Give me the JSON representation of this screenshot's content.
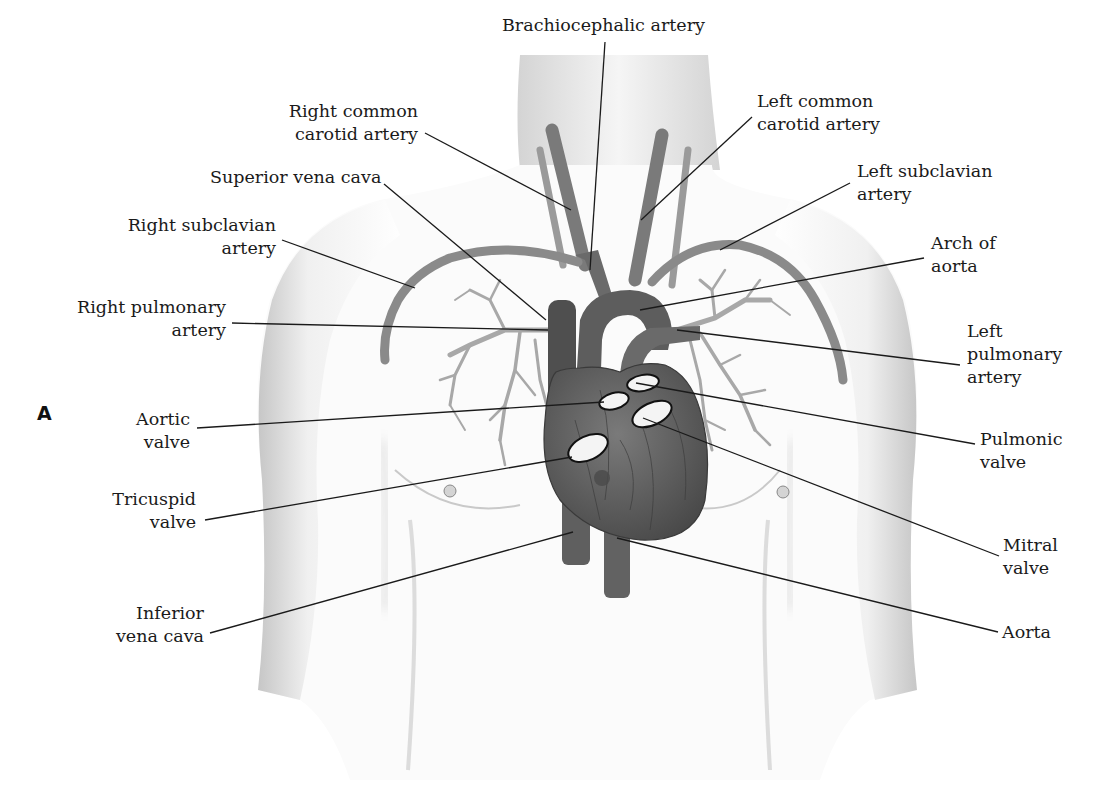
{
  "figure": {
    "panel_letter": "A",
    "type": "anatomical-diagram",
    "colors": {
      "background": "#ffffff",
      "skin_shade": "#c8c8c8",
      "vessel": "#6e6e6e",
      "heart": "#5a5a5a",
      "valve_fill": "#f4f4f4",
      "leader_line": "#1a1a1a",
      "text": "#1a1a1a"
    }
  },
  "labels": [
    {
      "id": "brachiocephalic-artery",
      "lines": [
        "Brachiocephalic artery"
      ],
      "align": "center",
      "x": 502,
      "y": 14,
      "w": 200,
      "anchor": [
        605,
        42
      ],
      "target": [
        590,
        270
      ]
    },
    {
      "id": "right-common-carotid-artery",
      "lines": [
        "Right common",
        "carotid artery"
      ],
      "align": "right",
      "x": 260,
      "y": 100,
      "w": 158,
      "anchor": [
        425,
        133
      ],
      "target": [
        571,
        210
      ]
    },
    {
      "id": "superior-vena-cava",
      "lines": [
        "Superior vena cava"
      ],
      "align": "right",
      "x": 210,
      "y": 166,
      "w": 166,
      "anchor": [
        384,
        184
      ],
      "target": [
        546,
        320
      ]
    },
    {
      "id": "right-subclavian-artery",
      "lines": [
        "Right subclavian",
        "artery"
      ],
      "align": "right",
      "x": 118,
      "y": 214,
      "w": 158,
      "anchor": [
        282,
        240
      ],
      "target": [
        415,
        288
      ]
    },
    {
      "id": "right-pulmonary-artery",
      "lines": [
        "Right pulmonary",
        "artery"
      ],
      "align": "right",
      "x": 60,
      "y": 296,
      "w": 166,
      "anchor": [
        232,
        323
      ],
      "target": [
        548,
        330
      ]
    },
    {
      "id": "left-common-carotid-artery",
      "lines": [
        "Left common",
        "carotid artery"
      ],
      "align": "left",
      "x": 757,
      "y": 90,
      "w": 160,
      "anchor": [
        752,
        117
      ],
      "target": [
        641,
        220
      ]
    },
    {
      "id": "left-subclavian-artery",
      "lines": [
        "Left subclavian",
        "artery"
      ],
      "align": "left",
      "x": 857,
      "y": 160,
      "w": 170,
      "anchor": [
        850,
        183
      ],
      "target": [
        720,
        250
      ]
    },
    {
      "id": "arch-of-aorta",
      "lines": [
        "Arch of",
        "aorta"
      ],
      "align": "left",
      "x": 931,
      "y": 232,
      "w": 100,
      "anchor": [
        924,
        258
      ],
      "target": [
        640,
        310
      ]
    },
    {
      "id": "left-pulmonary-artery",
      "lines": [
        "Left",
        "pulmonary",
        "artery"
      ],
      "align": "left",
      "x": 967,
      "y": 320,
      "w": 130,
      "anchor": [
        960,
        365
      ],
      "target": [
        677,
        330
      ]
    },
    {
      "id": "aortic-valve",
      "lines": [
        "Aortic",
        "valve"
      ],
      "align": "right",
      "x": 110,
      "y": 408,
      "w": 80,
      "anchor": [
        197,
        428
      ],
      "target": [
        604,
        402
      ]
    },
    {
      "id": "pulmonic-valve",
      "lines": [
        "Pulmonic",
        "valve"
      ],
      "align": "left",
      "x": 980,
      "y": 428,
      "w": 100,
      "anchor": [
        975,
        444
      ],
      "target": [
        636,
        383
      ]
    },
    {
      "id": "tricuspid-valve",
      "lines": [
        "Tricuspid",
        "valve"
      ],
      "align": "right",
      "x": 100,
      "y": 488,
      "w": 96,
      "anchor": [
        205,
        520
      ],
      "target": [
        572,
        457
      ]
    },
    {
      "id": "mitral-valve",
      "lines": [
        "Mitral",
        "valve"
      ],
      "align": "left",
      "x": 1003,
      "y": 534,
      "w": 80,
      "anchor": [
        999,
        556
      ],
      "target": [
        643,
        418
      ]
    },
    {
      "id": "inferior-vena-cava",
      "lines": [
        "Inferior",
        "vena cava"
      ],
      "align": "right",
      "x": 100,
      "y": 602,
      "w": 104,
      "anchor": [
        210,
        633
      ],
      "target": [
        573,
        532
      ]
    },
    {
      "id": "aorta",
      "lines": [
        "Aorta"
      ],
      "align": "left",
      "x": 1002,
      "y": 621,
      "w": 80,
      "anchor": [
        998,
        632
      ],
      "target": [
        617,
        538
      ]
    }
  ],
  "valves": [
    {
      "id": "pulmonic-valve-shape",
      "cx": 643,
      "cy": 383,
      "rx": 16,
      "ry": 8,
      "rot": -10
    },
    {
      "id": "aortic-valve-shape",
      "cx": 614,
      "cy": 401,
      "rx": 15,
      "ry": 8,
      "rot": -15
    },
    {
      "id": "mitral-valve-shape",
      "cx": 652,
      "cy": 414,
      "rx": 21,
      "ry": 11,
      "rot": -25
    },
    {
      "id": "tricuspid-valve-shape",
      "cx": 588,
      "cy": 448,
      "rx": 21,
      "ry": 12,
      "rot": -25
    }
  ]
}
